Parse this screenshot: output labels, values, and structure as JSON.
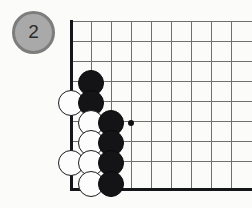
{
  "diagram": {
    "move_badge": {
      "label": "2",
      "fill_color": "#a9a9a9",
      "ring_color": "#7d7d7d",
      "text_color": "#2b2b2b"
    },
    "board": {
      "background_color": "#fbfbfa",
      "grid_line_color": "#6f6f6f",
      "edge_line_color": "#15161a",
      "grid_spacing_px": 20,
      "origin_x_px": 71,
      "origin_y_px": 21,
      "vertical_lines_x": [
        71,
        91,
        111,
        131,
        151,
        171,
        191,
        211,
        231
      ],
      "horizontal_lines_y": [
        21,
        41,
        61,
        81,
        101,
        121,
        141,
        161
      ],
      "bottom_edge_y": 188,
      "left_edge_x": 71,
      "left_edge_is_border": true,
      "bottom_edge_is_border": true
    },
    "stones": [
      {
        "color": "black",
        "cx": 91,
        "cy": 83,
        "r": 13
      },
      {
        "color": "white",
        "cx": 71,
        "cy": 103,
        "r": 13
      },
      {
        "color": "black",
        "cx": 91,
        "cy": 103,
        "r": 13
      },
      {
        "color": "white",
        "cx": 91,
        "cy": 123,
        "r": 13
      },
      {
        "color": "black",
        "cx": 111,
        "cy": 123,
        "r": 13
      },
      {
        "color": "white",
        "cx": 91,
        "cy": 143,
        "r": 13
      },
      {
        "color": "black",
        "cx": 111,
        "cy": 143,
        "r": 13
      },
      {
        "color": "white",
        "cx": 71,
        "cy": 163,
        "r": 13
      },
      {
        "color": "white",
        "cx": 91,
        "cy": 163,
        "r": 13
      },
      {
        "color": "black",
        "cx": 111,
        "cy": 163,
        "r": 13
      },
      {
        "color": "white",
        "cx": 91,
        "cy": 184,
        "r": 13
      },
      {
        "color": "black",
        "cx": 111,
        "cy": 184,
        "r": 13
      }
    ],
    "marked_points": [
      {
        "kind": "star-point",
        "cx": 131,
        "cy": 123,
        "size": 6
      }
    ]
  }
}
